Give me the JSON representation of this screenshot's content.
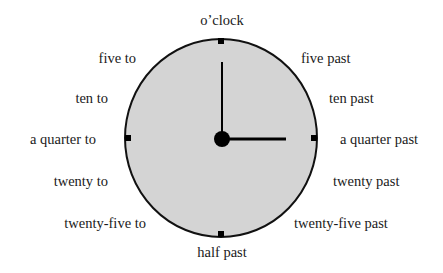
{
  "diagram": {
    "type": "clock-face",
    "center": {
      "x": 221,
      "y": 138
    },
    "radius_x": 96,
    "radius_y": 99,
    "colors": {
      "face": "#d4d4d4",
      "outline": "#111111",
      "hands": "#000000",
      "text": "#1a1a1a"
    },
    "hands": {
      "minute_points_to": "12",
      "hour_points_to": "3"
    }
  },
  "labels": {
    "top": "o’clock",
    "bottom": "half past",
    "right": [
      "five past",
      "ten past",
      "a quarter past",
      "twenty past",
      "twenty-five past"
    ],
    "left": [
      "five to",
      "ten to",
      "a quarter to",
      "twenty to",
      "twenty-five to"
    ]
  }
}
